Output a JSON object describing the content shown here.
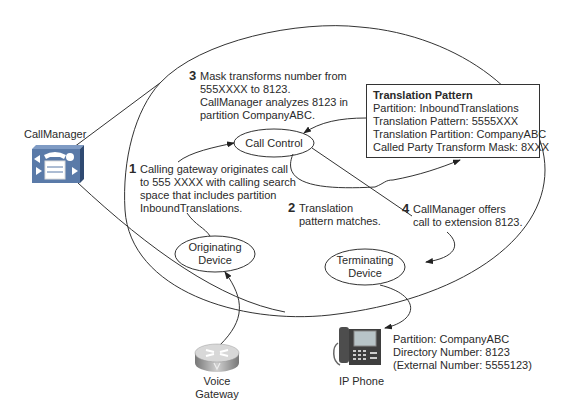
{
  "diagram": {
    "callmanager": {
      "label": "CallManager"
    },
    "call_control": {
      "label": "Call Control"
    },
    "originating_device": {
      "line1": "Originating",
      "line2": "Device"
    },
    "terminating_device": {
      "line1": "Terminating",
      "line2": "Device"
    },
    "voice_gateway": {
      "line1": "Voice",
      "line2": "Gateway"
    },
    "ip_phone": {
      "label": "IP Phone",
      "details": [
        "Partition: CompanyABC",
        "Directory Number: 8123",
        "(External Number: 5555123)"
      ]
    },
    "translation_pattern": {
      "title": "Translation Pattern",
      "lines": [
        "Partition: InboundTranslations",
        "Translation Pattern: 5555XXX",
        "Translation Partition: CompanyABC",
        "Called Party Transform Mask: 8XXX"
      ]
    },
    "steps": [
      {
        "num": "1",
        "lines": [
          "Calling gateway originates call",
          "to 555 XXXX with calling search",
          "space that includes partition",
          "InboundTranslations."
        ]
      },
      {
        "num": "2",
        "lines": [
          "Translation",
          "pattern matches."
        ]
      },
      {
        "num": "3",
        "lines": [
          "Mask transforms number from",
          "555XXXX to 8123.",
          "CallManager analyzes 8123 in",
          "partition CompanyABC."
        ]
      },
      {
        "num": "4",
        "lines": [
          "CallManager offers",
          "call to extension 8123."
        ]
      }
    ],
    "colors": {
      "line": "#333333",
      "icon_blue": "#5a7aa8",
      "icon_gray": "#9a9a9a"
    }
  }
}
